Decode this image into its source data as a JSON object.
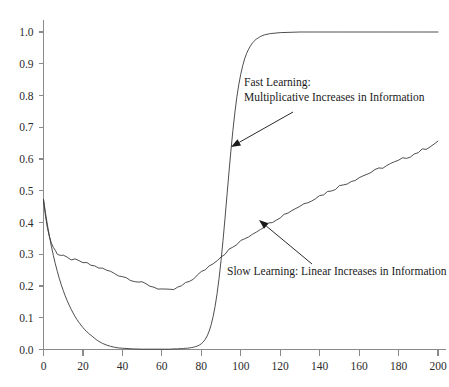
{
  "chart_data": {
    "type": "line",
    "title": "",
    "subtitle": "",
    "xlabel": "",
    "ylabel": "",
    "xlim": [
      0,
      200
    ],
    "ylim": [
      0.0,
      1.0
    ],
    "grid": false,
    "legend_position": "none",
    "x_ticks": [
      0,
      20,
      40,
      60,
      80,
      100,
      120,
      140,
      160,
      180,
      200
    ],
    "x_tick_labels": [
      "0",
      "20",
      "40",
      "60",
      "80",
      "100",
      "120",
      "140",
      "160",
      "180",
      "200"
    ],
    "y_ticks": [
      0.0,
      0.1,
      0.2,
      0.3,
      0.4,
      0.5,
      0.6,
      0.7,
      0.8,
      0.9,
      1.0
    ],
    "y_tick_labels": [
      "0.0",
      "0.1",
      "0.2",
      "0.3",
      "0.4",
      "0.5",
      "0.6",
      "0.7",
      "0.8",
      "0.9",
      "1.0"
    ],
    "series": [
      {
        "name": "Fast Learning: Multiplicative Increases in Information",
        "color": "#3a3a3a",
        "x": [
          0,
          1,
          2,
          3,
          4,
          5,
          6,
          7,
          8,
          9,
          10,
          11,
          12,
          13,
          14,
          15,
          16,
          17,
          18,
          19,
          20,
          21,
          22,
          23,
          24,
          25,
          26,
          27,
          28,
          30,
          32,
          34,
          36,
          38,
          40,
          45,
          50,
          55,
          60,
          62,
          64,
          66,
          68,
          70,
          71,
          72,
          73,
          74,
          75,
          76,
          77,
          78,
          79,
          80,
          81,
          82,
          83,
          84,
          85,
          86,
          87,
          88,
          89,
          90,
          91,
          92,
          93,
          94,
          95,
          96,
          97,
          98,
          99,
          100,
          101,
          102,
          103,
          104,
          105,
          106,
          107,
          108,
          109,
          110,
          112,
          115,
          120,
          130,
          140,
          150,
          160,
          170,
          180,
          190,
          200
        ],
        "y": [
          0.472,
          0.43,
          0.392,
          0.357,
          0.325,
          0.296,
          0.27,
          0.246,
          0.224,
          0.204,
          0.186,
          0.169,
          0.154,
          0.14,
          0.127,
          0.115,
          0.104,
          0.094,
          0.085,
          0.077,
          0.069,
          0.062,
          0.056,
          0.05,
          0.045,
          0.04,
          0.035,
          0.03,
          0.026,
          0.019,
          0.014,
          0.01,
          0.007,
          0.005,
          0.004,
          0.002,
          0.001,
          0.001,
          0.001,
          0.001,
          0.001,
          0.002,
          0.002,
          0.003,
          0.003,
          0.004,
          0.004,
          0.005,
          0.006,
          0.007,
          0.009,
          0.011,
          0.014,
          0.018,
          0.024,
          0.032,
          0.043,
          0.058,
          0.078,
          0.104,
          0.136,
          0.176,
          0.224,
          0.28,
          0.343,
          0.412,
          0.484,
          0.556,
          0.625,
          0.689,
          0.745,
          0.794,
          0.834,
          0.867,
          0.894,
          0.916,
          0.933,
          0.946,
          0.957,
          0.966,
          0.973,
          0.978,
          0.982,
          0.986,
          0.991,
          0.995,
          0.998,
          1.0,
          1.0,
          1.0,
          1.0,
          1.0,
          1.0,
          1.0,
          1.0
        ]
      },
      {
        "name": "Slow Learning: Linear Increases in Information",
        "color": "#3a3a3a",
        "x": [
          0,
          1,
          2,
          3,
          4,
          5,
          6,
          7,
          8,
          9,
          10,
          12,
          14,
          16,
          18,
          20,
          22,
          24,
          26,
          28,
          30,
          32,
          34,
          36,
          38,
          40,
          42,
          44,
          46,
          48,
          50,
          52,
          54,
          56,
          58,
          60,
          62,
          64,
          66,
          68,
          70,
          72,
          74,
          76,
          78,
          80,
          82,
          84,
          86,
          88,
          90,
          92,
          94,
          96,
          98,
          100,
          102,
          104,
          106,
          108,
          110,
          112,
          114,
          116,
          118,
          120,
          122,
          124,
          126,
          128,
          130,
          132,
          134,
          136,
          138,
          140,
          142,
          144,
          146,
          148,
          150,
          152,
          154,
          156,
          158,
          160,
          162,
          164,
          166,
          168,
          170,
          172,
          174,
          176,
          178,
          180,
          182,
          184,
          186,
          188,
          190,
          192,
          194,
          196,
          198,
          200
        ],
        "y": [
          0.472,
          0.42,
          0.382,
          0.355,
          0.336,
          0.322,
          0.311,
          0.303,
          0.299,
          0.296,
          0.293,
          0.288,
          0.285,
          0.281,
          0.277,
          0.274,
          0.27,
          0.266,
          0.262,
          0.258,
          0.254,
          0.249,
          0.245,
          0.24,
          0.235,
          0.231,
          0.226,
          0.222,
          0.217,
          0.213,
          0.209,
          0.205,
          0.201,
          0.197,
          0.193,
          0.19,
          0.186,
          0.186,
          0.189,
          0.194,
          0.2,
          0.207,
          0.215,
          0.224,
          0.233,
          0.243,
          0.253,
          0.263,
          0.273,
          0.283,
          0.293,
          0.303,
          0.313,
          0.322,
          0.331,
          0.34,
          0.349,
          0.357,
          0.365,
          0.373,
          0.381,
          0.389,
          0.396,
          0.404,
          0.411,
          0.418,
          0.425,
          0.432,
          0.439,
          0.446,
          0.452,
          0.459,
          0.465,
          0.472,
          0.478,
          0.484,
          0.49,
          0.496,
          0.502,
          0.508,
          0.514,
          0.519,
          0.525,
          0.531,
          0.536,
          0.542,
          0.547,
          0.553,
          0.558,
          0.563,
          0.569,
          0.574,
          0.579,
          0.584,
          0.589,
          0.594,
          0.6,
          0.605,
          0.61,
          0.616,
          0.622,
          0.628,
          0.634,
          0.641,
          0.647,
          0.653
        ]
      }
    ],
    "annotations": [
      {
        "id": "fast-learning",
        "lines": [
          "Fast Learning:",
          "Multiplicative Increases in Information"
        ],
        "text_x": 244,
        "text_y": 86,
        "arrow_from_x": 293,
        "arrow_from_y": 112,
        "arrow_to_x": 231,
        "arrow_to_y": 147
      },
      {
        "id": "slow-learning",
        "lines": [
          "Slow Learning: Linear Increases in Information"
        ],
        "text_x": 227,
        "text_y": 275,
        "arrow_from_x": 312,
        "arrow_from_y": 264,
        "arrow_to_x": 259,
        "arrow_to_y": 220
      }
    ]
  },
  "colors": {
    "curve": "#3a3a3a",
    "axis": "#8a8a8a",
    "text": "#1a1a1a",
    "background": "#ffffff"
  }
}
